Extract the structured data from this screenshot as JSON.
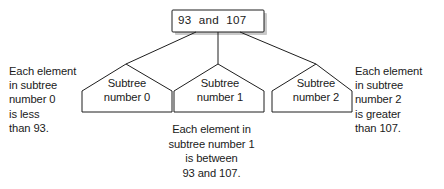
{
  "figure": {
    "background_color": "#ffffff",
    "line_color": "#1e1e1e",
    "text_color": "#1a1a1a",
    "shadow_color": "#c9c9c9",
    "width": 444,
    "height": 189
  },
  "root": {
    "label": "93  and  107",
    "keys": [
      "93",
      "107"
    ],
    "separator": "and"
  },
  "subtrees": [
    {
      "label": "Subtree\nnumber 0",
      "name": "Subtree",
      "number": "0"
    },
    {
      "label": "Subtree\nnumber 1",
      "name": "Subtree",
      "number": "1"
    },
    {
      "label": "Subtree\nnumber 2",
      "name": "Subtree",
      "number": "2"
    }
  ],
  "notes": {
    "left": "Each element\nin subtree\nnumber 0\nis less\nthan 93.",
    "center": "Each element in\nsubtree number 1\nis between\n93 and 107.",
    "right": "Each element\nin subtree\nnumber 2\nis greater\nthan 107."
  }
}
